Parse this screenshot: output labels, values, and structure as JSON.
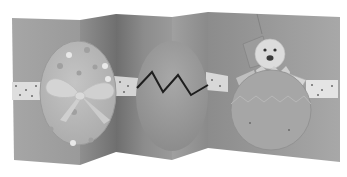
{
  "image": {
    "subject": "Folded concertina Easter card",
    "width": 347,
    "height": 177,
    "palette": {
      "background": "#ffffff",
      "panel_light": "#a9a9a9",
      "panel_mid": "#939393",
      "panel_dark": "#7b7b7b",
      "ribbon": "#e2e2e2",
      "ribbon_dots": "#6a6a6a",
      "egg_left": "#b8b8b8",
      "egg_middle": "#9c9c9c",
      "shell_right": "#a4a4a4",
      "chick": "#dcdcdc",
      "zigzag": "#1e1e1e",
      "bow": "#d2d2d2"
    },
    "elements": [
      {
        "name": "left-panel",
        "description": "Card panel with polka-dot egg tied with ribbon bow"
      },
      {
        "name": "middle-panel",
        "description": "Card panel with plain egg cracked by black zigzag line"
      },
      {
        "name": "right-panel",
        "description": "Card panel with chick hatching from egg shell"
      },
      {
        "name": "ribbon-band",
        "description": "White polka-dot ribbon band running across all panels"
      }
    ]
  }
}
